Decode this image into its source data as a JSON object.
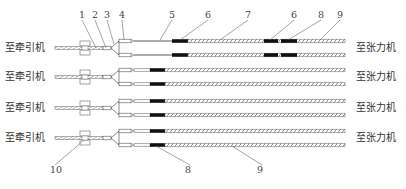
{
  "diagram": {
    "left_label": "至牵引机",
    "right_label": "至张力机",
    "rows": [
      {
        "left_label": "至牵引机",
        "right_label": "至张力机",
        "y": 48
      },
      {
        "left_label": "至牵引机",
        "right_label": "至张力机",
        "y": 77
      },
      {
        "left_label": "至牵引机",
        "right_label": "至张力机",
        "y": 108
      },
      {
        "left_label": "至牵引机",
        "right_label": "至张力机",
        "y": 138
      }
    ],
    "callouts_top": [
      {
        "id": "1",
        "x": 79,
        "y": 12
      },
      {
        "id": "2",
        "x": 92,
        "y": 12
      },
      {
        "id": "3",
        "x": 104,
        "y": 12
      },
      {
        "id": "4",
        "x": 119,
        "y": 12
      },
      {
        "id": "5",
        "x": 169,
        "y": 12
      },
      {
        "id": "6",
        "x": 205,
        "y": 12
      },
      {
        "id": "7",
        "x": 245,
        "y": 12
      },
      {
        "id": "6b",
        "label": "6",
        "x": 291,
        "y": 12
      },
      {
        "id": "8",
        "x": 318,
        "y": 12
      },
      {
        "id": "9",
        "x": 337,
        "y": 12
      }
    ],
    "callouts_bottom": [
      {
        "id": "10",
        "x": 50,
        "y": 167
      },
      {
        "id": "8",
        "x": 185,
        "y": 167
      },
      {
        "id": "9",
        "x": 257,
        "y": 167
      }
    ],
    "colors": {
      "line": "#555555",
      "sleeve": "#111111",
      "text": "#333333"
    }
  }
}
